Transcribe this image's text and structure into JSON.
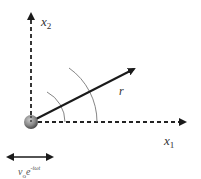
{
  "diagram": {
    "type": "vector-coordinate-sketch",
    "colors": {
      "axis": "#222222",
      "vector": "#1a1a1a",
      "arc": "#777777",
      "sphere_light": "#b5b5b5",
      "sphere_dark": "#555555",
      "text": "#333333"
    },
    "origin": {
      "x": 31,
      "y": 122
    },
    "axes": {
      "x1": {
        "label_var": "x",
        "label_sub": "1",
        "style": "dashed",
        "end": {
          "x": 189,
          "y": 122
        }
      },
      "x2": {
        "label_var": "x",
        "label_sub": "2",
        "style": "dashed",
        "end": {
          "x": 31,
          "y": 10
        }
      }
    },
    "vector": {
      "label": "r",
      "end": {
        "x": 138,
        "y": 67
      },
      "style": "solid"
    },
    "arcs": [
      {
        "radius": 34,
        "from_deg": 0,
        "to_deg": 62
      },
      {
        "radius": 66,
        "from_deg": 0,
        "to_deg": 55
      }
    ],
    "sphere": {
      "radius": 7
    },
    "oscillation": {
      "arrow": {
        "x1": 4,
        "x2": 56,
        "y": 157,
        "style": "double-headed"
      },
      "label_var": "v",
      "label_sub": "o",
      "label_base": "e",
      "label_exp": "-iωt"
    }
  }
}
